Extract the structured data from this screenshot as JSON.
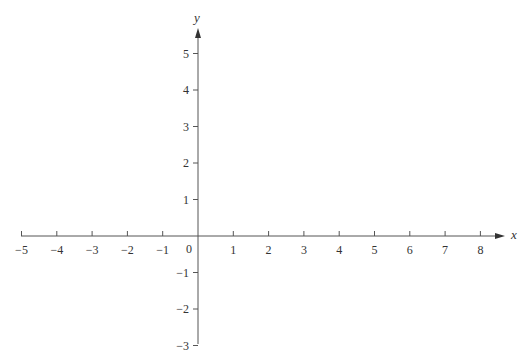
{
  "chart_data": {
    "type": "line",
    "title": "",
    "xlabel": "x",
    "ylabel": "y",
    "xlim": [
      -5,
      8
    ],
    "ylim": [
      -3,
      5
    ],
    "x_ticks": [
      -5,
      -4,
      -3,
      -2,
      -1,
      1,
      2,
      3,
      4,
      5,
      6,
      7,
      8
    ],
    "y_ticks": [
      5,
      4,
      3,
      2,
      1,
      -1,
      -2,
      -3
    ],
    "x_tick_labels": [
      "−5",
      "−4",
      "−3",
      "−2",
      "−1",
      "1",
      "2",
      "3",
      "4",
      "5",
      "6",
      "7",
      "8"
    ],
    "y_tick_labels": [
      "5",
      "4",
      "3",
      "2",
      "1",
      "−1",
      "−2",
      "−3"
    ],
    "origin_label": "0",
    "grid": false,
    "legend": null,
    "series": [],
    "axis_color": "#555555"
  },
  "layout": {
    "origin_px": [
      198,
      236
    ],
    "x_unit_px": 35.3,
    "y_unit_px": 36.5,
    "x_axis_start_px": 21,
    "x_axis_end_px": 505,
    "y_axis_top_px": 28,
    "y_axis_bottom_px": 344
  }
}
